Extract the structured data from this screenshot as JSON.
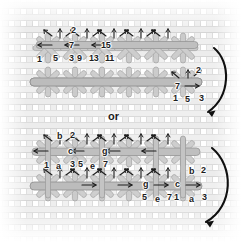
{
  "figure": {
    "connector_label": "or",
    "fabric": {
      "name": "even-weave canvas grid",
      "thread_color": "#e9e9e9",
      "thread_shadow": "#d2d2d2",
      "background": "#ffffff"
    },
    "stitch": {
      "fill_color": "#c9c9c9",
      "stroke_color": "#9c9c9c",
      "bar_color": "#bdbdbd",
      "bar_stroke": "#8f8f8f"
    },
    "ink_color": "#1d1d1d"
  },
  "diagrams": [
    {
      "id": "top",
      "name": "numbered-variation",
      "labels": [
        {
          "text": "2",
          "x": 71,
          "y": 29
        },
        {
          "text": "7",
          "x": 69,
          "y": 45
        },
        {
          "text": "15",
          "x": 101,
          "y": 45
        },
        {
          "text": "1",
          "x": 37,
          "y": 59
        },
        {
          "text": "5",
          "x": 53,
          "y": 58
        },
        {
          "text": "3",
          "x": 69,
          "y": 58
        },
        {
          "text": "9",
          "x": 77,
          "y": 58
        },
        {
          "text": "13",
          "x": 89,
          "y": 58
        },
        {
          "text": "11",
          "x": 105,
          "y": 58
        }
      ],
      "right_labels": [
        {
          "text": "2",
          "x": 196,
          "y": 70
        },
        {
          "text": "7",
          "x": 175,
          "y": 86
        },
        {
          "text": "1",
          "x": 173,
          "y": 98
        },
        {
          "text": "5",
          "x": 185,
          "y": 99
        },
        {
          "text": "3",
          "x": 199,
          "y": 98
        }
      ]
    },
    {
      "id": "bottom",
      "name": "lettered-variation",
      "labels": [
        {
          "text": "b",
          "x": 57,
          "y": 136
        },
        {
          "text": "2",
          "x": 70,
          "y": 135
        },
        {
          "text": "c",
          "x": 68,
          "y": 151
        },
        {
          "text": "g",
          "x": 102,
          "y": 151
        },
        {
          "text": "1",
          "x": 44,
          "y": 165
        },
        {
          "text": "a",
          "x": 56,
          "y": 166
        },
        {
          "text": "3",
          "x": 70,
          "y": 164
        },
        {
          "text": "5",
          "x": 78,
          "y": 164
        },
        {
          "text": "e",
          "x": 90,
          "y": 166
        },
        {
          "text": "7",
          "x": 103,
          "y": 164
        }
      ],
      "right_labels": [
        {
          "text": "b",
          "x": 189,
          "y": 171
        },
        {
          "text": "2",
          "x": 201,
          "y": 170
        },
        {
          "text": "g",
          "x": 143,
          "y": 184
        },
        {
          "text": "c",
          "x": 175,
          "y": 184
        },
        {
          "text": "5",
          "x": 142,
          "y": 197
        },
        {
          "text": "e",
          "x": 155,
          "y": 199
        },
        {
          "text": "7",
          "x": 167,
          "y": 197
        },
        {
          "text": "1",
          "x": 174,
          "y": 197
        },
        {
          "text": "a",
          "x": 189,
          "y": 199
        },
        {
          "text": "3",
          "x": 202,
          "y": 197
        }
      ]
    }
  ]
}
